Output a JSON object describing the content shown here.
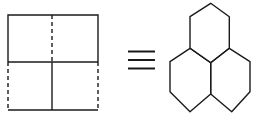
{
  "diagram": {
    "left_figure": {
      "name": "subdivided-rectangle",
      "cells": 4
    },
    "relation_symbol": "≡",
    "right_figure": {
      "name": "three-fused-hexagons",
      "hexagons": 3
    },
    "colors": {
      "stroke": "#1a1a1a",
      "background": "#ffffff"
    }
  }
}
